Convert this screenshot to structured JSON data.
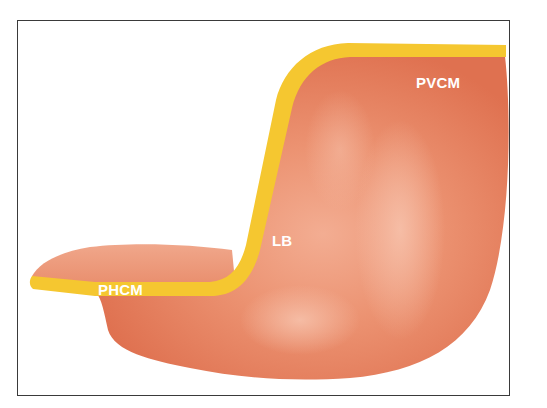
{
  "figure": {
    "labels": {
      "pvcm": "PVCM",
      "lb": "LB",
      "phcm": "PHCM"
    },
    "colors": {
      "body": "#e8825c",
      "body_dark": "#de6e4a",
      "body_light": "#f4b29a",
      "band": "#f5c730",
      "frame": "#3a3a3a",
      "label": "#ffffff"
    }
  }
}
